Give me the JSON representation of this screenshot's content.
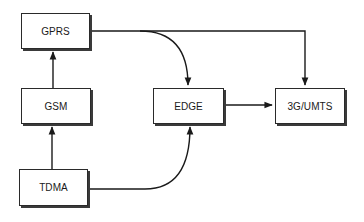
{
  "diagram": {
    "type": "flow",
    "nodes": [
      {
        "id": "gprs",
        "label": "GPRS"
      },
      {
        "id": "gsm",
        "label": "GSM"
      },
      {
        "id": "edge",
        "label": "EDGE"
      },
      {
        "id": "umts",
        "label": "3G/UMTS"
      },
      {
        "id": "tdma",
        "label": "TDMA"
      }
    ],
    "edges": [
      {
        "from": "tdma",
        "to": "gsm"
      },
      {
        "from": "gsm",
        "to": "gprs"
      },
      {
        "from": "gprs",
        "to": "edge"
      },
      {
        "from": "gprs",
        "to": "umts"
      },
      {
        "from": "tdma",
        "to": "edge"
      },
      {
        "from": "edge",
        "to": "umts"
      }
    ],
    "colors": {
      "line": "#1a1a1a",
      "box_border": "#2a2a2a",
      "shadow": "#3a3a3a",
      "background": "#ffffff"
    }
  }
}
